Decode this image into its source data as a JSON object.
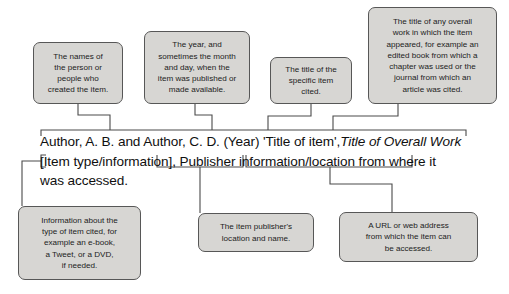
{
  "diagram": {
    "colors": {
      "box_fill": "#d7d6d3",
      "box_border": "#575757",
      "connector": "#4a4a4a",
      "text": "#101010"
    },
    "citation": {
      "line1_part1": "Author, A. B. and Author, C. D. (Year) 'Title of item',",
      "line1_part2_italic": "Title of Overall Work",
      "line2": "[Item type/information], Publisher information/location from where it",
      "line3": "was accessed."
    },
    "callouts_top": [
      {
        "id": "authors",
        "text": "The names of\nthe person or\npeople who\ncreated the item."
      },
      {
        "id": "year",
        "text": "The year, and\nsometimes the month\nand day, when the\nitem was published or\nmade available."
      },
      {
        "id": "item-title",
        "text": "The title of the\nspecific item\ncited."
      },
      {
        "id": "overall-work",
        "text": "The title of any overall\nwork in which the item\nappeared, for example an\nedited book from which a\nchapter was used or the\njournal from which an\narticle was cited."
      }
    ],
    "callouts_bottom": [
      {
        "id": "item-type",
        "text": "Information about the\ntype of item cited, for\nexample an e-book,\na Tweet, or a DVD,\nif needed."
      },
      {
        "id": "publisher",
        "text": "The item publisher's\nlocation and name."
      },
      {
        "id": "url",
        "text": "A URL or web address\nfrom which the item can\nbe accessed."
      }
    ]
  }
}
